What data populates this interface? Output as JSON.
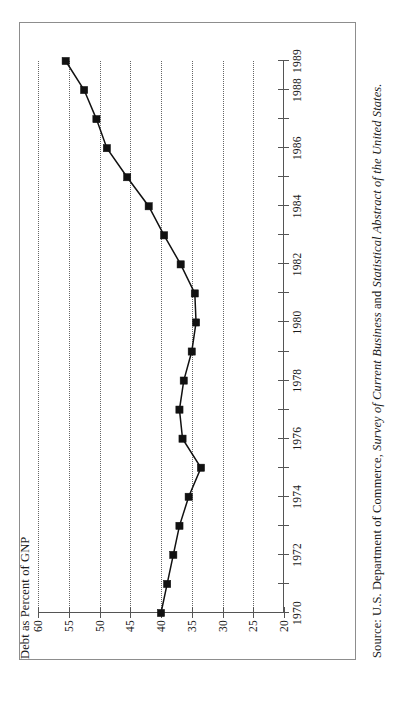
{
  "figure": {
    "axis_title": "Debt as Percent of GNP",
    "source_prefix": "Source: U.S. Department of Commerce, ",
    "source_italic_1": "Survey of Current Business",
    "source_middle": " and ",
    "source_italic_2": "Statistical Abstract of the United States.",
    "frame_color": "#8d8d8d",
    "series_color": "#111111",
    "grid_color": "#4a4a4a"
  },
  "chart_data": {
    "type": "line",
    "title": "Debt as Percent of GNP",
    "xlabel": "",
    "ylabel": "Debt as Percent of GNP",
    "orientation": "rotated-90-ccw",
    "grid": true,
    "legend": "none",
    "xlim": [
      1970,
      1989
    ],
    "ylim": [
      20,
      60
    ],
    "y_ticks": [
      60,
      55,
      50,
      45,
      40,
      35,
      30,
      25,
      20
    ],
    "y_tick_labels": [
      "60",
      "55",
      "50",
      "45",
      "40",
      "35",
      "30",
      "25",
      "20"
    ],
    "x_ticks": [
      1970,
      1971,
      1972,
      1973,
      1974,
      1975,
      1976,
      1977,
      1978,
      1979,
      1980,
      1981,
      1982,
      1983,
      1984,
      1985,
      1986,
      1987,
      1988,
      1989
    ],
    "x_tick_labels_shown": [
      "1970",
      "1972",
      "1974",
      "1976",
      "1978",
      "1980",
      "1982",
      "1984",
      "1986",
      "1988",
      "1989"
    ],
    "x": [
      1970,
      1971,
      1972,
      1973,
      1974,
      1975,
      1976,
      1977,
      1978,
      1979,
      1980,
      1981,
      1982,
      1983,
      1984,
      1985,
      1986,
      1987,
      1988,
      1989
    ],
    "values": [
      40.0,
      39.0,
      38.0,
      37.0,
      35.5,
      33.5,
      36.5,
      37.0,
      36.3,
      35.0,
      34.3,
      34.5,
      36.8,
      39.5,
      42.0,
      45.5,
      48.8,
      50.5,
      52.5,
      55.5
    ],
    "marker": "square",
    "series": [
      {
        "name": "Debt as Percent of GNP",
        "values": [
          40.0,
          39.0,
          38.0,
          37.0,
          35.5,
          33.5,
          36.5,
          37.0,
          36.3,
          35.0,
          34.3,
          34.5,
          36.8,
          39.5,
          42.0,
          45.5,
          48.8,
          50.5,
          52.5,
          55.5
        ]
      }
    ]
  }
}
